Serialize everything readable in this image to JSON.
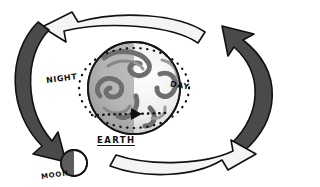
{
  "diagram": {
    "background_color": "#ffffff",
    "ink_color": "#111111",
    "labels": {
      "night": "NIGHT",
      "day": "DAY",
      "earth": "EARTH",
      "moon": "MOON"
    },
    "bodies": [
      {
        "name": "earth",
        "label": "EARTH",
        "shape": "sphere",
        "cx": 134,
        "cy": 88,
        "r": 46,
        "night_side": "left",
        "day_side": "right",
        "outline_color": "#151515",
        "day_fill": "#f2f2f2",
        "night_fill": "#8d8d8d",
        "cloud_color": "#6e6e6e"
      },
      {
        "name": "moon",
        "label": "MOON",
        "shape": "sphere",
        "cx": 74,
        "cy": 163,
        "r": 13,
        "lit_side": "right",
        "shadow_side": "left",
        "outline_color": "#151515",
        "lit_fill": "#ffffff",
        "shadow_fill": "#5d5d5d"
      }
    ],
    "terminator": {
      "name": "day-night-terminator",
      "style": "dotted-ellipse",
      "dot_color": "#111111",
      "note": "dotted circle separating NIGHT and DAY"
    },
    "rotation_indicator": {
      "name": "equator-rotation-arrow",
      "style": "dotted-line-with-arrowhead",
      "direction": "eastward",
      "arrow_color": "#111111"
    },
    "orbit_arrows": [
      {
        "name": "top-arrow",
        "fill": "#f4f4f4",
        "stroke": "#111111",
        "direction": "left",
        "position": "top"
      },
      {
        "name": "right-arrow",
        "fill": "#4a4a4a",
        "stroke": "#111111",
        "direction": "up-left",
        "position": "right"
      },
      {
        "name": "bottom-arrow",
        "fill": "#f4f4f4",
        "stroke": "#111111",
        "direction": "right",
        "position": "bottom"
      },
      {
        "name": "left-arrow",
        "fill": "#4a4a4a",
        "stroke": "#111111",
        "direction": "down-right",
        "position": "left"
      }
    ],
    "colors": {
      "light_arrow": "#f4f4f4",
      "dark_arrow": "#4a4a4a",
      "outline": "#111111",
      "earth_night": "#8d8d8d",
      "earth_day": "#f2f2f2"
    }
  }
}
